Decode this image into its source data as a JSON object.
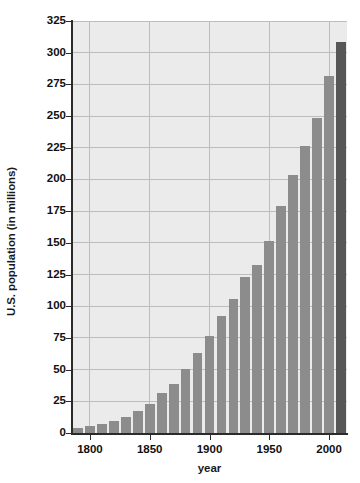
{
  "chart_data": {
    "type": "bar",
    "title": "",
    "subtitle": "",
    "xlabel": "year",
    "ylabel": "U.S. population (in millions)",
    "xlim": [
      1785,
      2015
    ],
    "ylim": [
      0,
      325
    ],
    "grid": true,
    "legend": null,
    "y_ticks": [
      0,
      25,
      50,
      75,
      100,
      125,
      150,
      175,
      200,
      225,
      250,
      275,
      300,
      325
    ],
    "y_tick_labels": [
      "0",
      "25",
      "50",
      "75",
      "100",
      "125",
      "150",
      "175",
      "200",
      "225",
      "250",
      "275",
      "300",
      "325"
    ],
    "x_ticks": [
      1800,
      1850,
      1900,
      1950,
      2000
    ],
    "x_tick_labels": [
      "1800",
      "1850",
      "1900",
      "1950",
      "2000"
    ],
    "categories": [
      1790,
      1800,
      1810,
      1820,
      1830,
      1840,
      1850,
      1860,
      1870,
      1880,
      1890,
      1900,
      1910,
      1920,
      1930,
      1940,
      1950,
      1960,
      1970,
      1980,
      1990,
      2000,
      2010
    ],
    "values": [
      3.9,
      5.3,
      7.2,
      9.6,
      12.9,
      17.1,
      23.2,
      31.4,
      38.6,
      50.2,
      63.0,
      76.2,
      92.2,
      106.0,
      123.2,
      132.2,
      151.3,
      179.3,
      203.3,
      226.5,
      248.7,
      281.4,
      308.7
    ],
    "bar_colors": [
      "#8c8c8c",
      "#8c8c8c",
      "#8c8c8c",
      "#8c8c8c",
      "#8c8c8c",
      "#8c8c8c",
      "#8c8c8c",
      "#8c8c8c",
      "#8c8c8c",
      "#8c8c8c",
      "#8c8c8c",
      "#8c8c8c",
      "#8c8c8c",
      "#8c8c8c",
      "#8c8c8c",
      "#8c8c8c",
      "#8c8c8c",
      "#8c8c8c",
      "#8c8c8c",
      "#8c8c8c",
      "#8c8c8c",
      "#8c8c8c",
      "#575757"
    ],
    "highlight_index": 22,
    "colors": {
      "bar": "#8c8c8c",
      "bar_highlight": "#575757",
      "plot_background": "#ebebeb",
      "gridline": "#bdbdbd",
      "axis": "#2b2b2b",
      "text": "#111111",
      "figure_background": "#ffffff"
    }
  }
}
